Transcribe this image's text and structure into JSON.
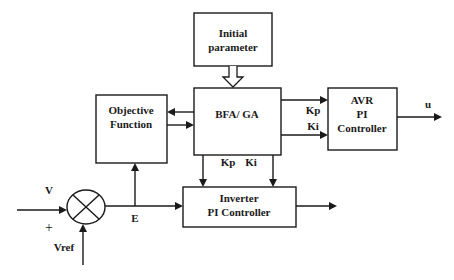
{
  "blocks": {
    "initial_parameter": {
      "line1": "Initial",
      "line2": "parameter"
    },
    "bfa_ga": {
      "label": "BFA/ GA"
    },
    "objective_function": {
      "line1": "Objective",
      "line2": "Function"
    },
    "avr_pi_controller": {
      "line1": "AVR",
      "line2": "PI",
      "line3": "Controller"
    },
    "inverter_pi_controller": {
      "line1": "Inverter",
      "line2": "PI Controller"
    }
  },
  "summing_junction": {
    "symbol": "cross-circle"
  },
  "signals": {
    "v": "V",
    "plus": "+",
    "vref": "Vref",
    "e": "E",
    "u": "u",
    "avr_kp": "Kp",
    "avr_ki": "Ki",
    "inv_kp": "Kp",
    "inv_ki": "Ki"
  },
  "colors": {
    "stroke": "#1a1a1a",
    "background": "#ffffff"
  }
}
